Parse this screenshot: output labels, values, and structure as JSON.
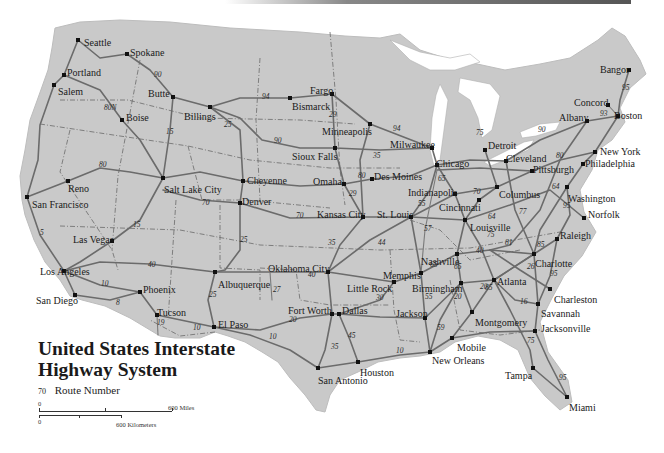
{
  "title": {
    "line1": "United States Interstate",
    "line2": "Highway System"
  },
  "legend": {
    "route_sample_number": "70",
    "route_label": "Route Number"
  },
  "scale": {
    "miles_zero": "0",
    "miles_label": "600 Miles",
    "km_zero": "0",
    "km_label": "600 Kilometers"
  },
  "colors": {
    "land": "#c9c9c9",
    "water": "#ffffff",
    "highway": "#6b6b6b",
    "city_dot": "#111111",
    "text": "#1a1a1a"
  },
  "cities": [
    {
      "name": "Seattle",
      "x": 78,
      "y": 40,
      "lx": 84,
      "ly": 43
    },
    {
      "name": "Spokane",
      "x": 127,
      "y": 54,
      "lx": 130,
      "ly": 53
    },
    {
      "name": "Portland",
      "x": 64,
      "y": 75,
      "lx": 67,
      "ly": 73
    },
    {
      "name": "Salem",
      "x": 54,
      "y": 85,
      "lx": 58,
      "ly": 92
    },
    {
      "name": "Butte",
      "x": 173,
      "y": 97,
      "lx": 148,
      "ly": 94
    },
    {
      "name": "Boise",
      "x": 122,
      "y": 120,
      "lx": 126,
      "ly": 118
    },
    {
      "name": "Billings",
      "x": 210,
      "y": 107,
      "lx": 184,
      "ly": 117
    },
    {
      "name": "Fargo",
      "x": 332,
      "y": 94,
      "lx": 310,
      "ly": 91
    },
    {
      "name": "Bismarck",
      "x": 290,
      "y": 98,
      "lx": 292,
      "ly": 107
    },
    {
      "name": "Minneapolis",
      "x": 370,
      "y": 124,
      "lx": 322,
      "ly": 132
    },
    {
      "name": "Milwaukee",
      "x": 432,
      "y": 148,
      "lx": 390,
      "ly": 145
    },
    {
      "name": "Sioux Falls",
      "x": 335,
      "y": 148,
      "lx": 292,
      "ly": 157
    },
    {
      "name": "Detroit",
      "x": 485,
      "y": 150,
      "lx": 488,
      "ly": 146
    },
    {
      "name": "Chicago",
      "x": 437,
      "y": 165,
      "lx": 436,
      "ly": 164
    },
    {
      "name": "Cleveland",
      "x": 506,
      "y": 161,
      "lx": 506,
      "ly": 159
    },
    {
      "name": "Bangor",
      "x": 629,
      "y": 70,
      "lx": 600,
      "ly": 70
    },
    {
      "name": "Concord",
      "x": 608,
      "y": 105,
      "lx": 574,
      "ly": 103
    },
    {
      "name": "Albany",
      "x": 587,
      "y": 121,
      "lx": 559,
      "ly": 118
    },
    {
      "name": "Boston",
      "x": 618,
      "y": 116,
      "lx": 614,
      "ly": 116
    },
    {
      "name": "New York",
      "x": 595,
      "y": 152,
      "lx": 600,
      "ly": 152
    },
    {
      "name": "Philadelphia",
      "x": 583,
      "y": 164,
      "lx": 585,
      "ly": 164
    },
    {
      "name": "Pittsburgh",
      "x": 532,
      "y": 171,
      "lx": 533,
      "ly": 170
    },
    {
      "name": "Washington",
      "x": 567,
      "y": 187,
      "lx": 568,
      "ly": 199
    },
    {
      "name": "Norfolk",
      "x": 584,
      "y": 218,
      "lx": 588,
      "ly": 215
    },
    {
      "name": "Reno",
      "x": 68,
      "y": 181,
      "lx": 68,
      "ly": 189
    },
    {
      "name": "San Francisco",
      "x": 27,
      "y": 197,
      "lx": 32,
      "ly": 205
    },
    {
      "name": "Salt Lake City",
      "x": 163,
      "y": 178,
      "lx": 164,
      "ly": 190
    },
    {
      "name": "Cheyenne",
      "x": 243,
      "y": 181,
      "lx": 247,
      "ly": 181
    },
    {
      "name": "Omaha",
      "x": 344,
      "y": 184,
      "lx": 313,
      "ly": 182
    },
    {
      "name": "Des Moines",
      "x": 372,
      "y": 179,
      "lx": 374,
      "ly": 177
    },
    {
      "name": "Denver",
      "x": 240,
      "y": 203,
      "lx": 242,
      "ly": 202
    },
    {
      "name": "Kansas City",
      "x": 363,
      "y": 217,
      "lx": 317,
      "ly": 215
    },
    {
      "name": "St. Louis",
      "x": 411,
      "y": 217,
      "lx": 377,
      "ly": 215
    },
    {
      "name": "Indianapolis",
      "x": 455,
      "y": 194,
      "lx": 408,
      "ly": 193
    },
    {
      "name": "Columbus",
      "x": 497,
      "y": 187,
      "lx": 499,
      "ly": 195
    },
    {
      "name": "Cincinnati",
      "x": 479,
      "y": 200,
      "lx": 439,
      "ly": 208
    },
    {
      "name": "Louisville",
      "x": 465,
      "y": 220,
      "lx": 470,
      "ly": 228
    },
    {
      "name": "Raleigh",
      "x": 557,
      "y": 239,
      "lx": 560,
      "ly": 236
    },
    {
      "name": "Las Vegas",
      "x": 112,
      "y": 241,
      "lx": 73,
      "ly": 240
    },
    {
      "name": "Los Angeles",
      "x": 64,
      "y": 271,
      "lx": 40,
      "ly": 272
    },
    {
      "name": "San Diego",
      "x": 75,
      "y": 295,
      "lx": 36,
      "ly": 301
    },
    {
      "name": "Phoenix",
      "x": 140,
      "y": 292,
      "lx": 143,
      "ly": 290
    },
    {
      "name": "Tucson",
      "x": 157,
      "y": 315,
      "lx": 157,
      "ly": 313
    },
    {
      "name": "Albuquerque",
      "x": 215,
      "y": 272,
      "lx": 218,
      "ly": 285
    },
    {
      "name": "El Paso",
      "x": 214,
      "y": 327,
      "lx": 218,
      "ly": 325
    },
    {
      "name": "Oklahoma City",
      "x": 328,
      "y": 272,
      "lx": 268,
      "ly": 269
    },
    {
      "name": "Memphis",
      "x": 421,
      "y": 273,
      "lx": 383,
      "ly": 276
    },
    {
      "name": "Nashville",
      "x": 457,
      "y": 254,
      "lx": 421,
      "ly": 262
    },
    {
      "name": "Little Rock",
      "x": 394,
      "y": 282,
      "lx": 347,
      "ly": 289
    },
    {
      "name": "Birmingham",
      "x": 461,
      "y": 283,
      "lx": 412,
      "ly": 289
    },
    {
      "name": "Charlotte",
      "x": 534,
      "y": 254,
      "lx": 535,
      "ly": 264
    },
    {
      "name": "Atlanta",
      "x": 494,
      "y": 280,
      "lx": 497,
      "ly": 282
    },
    {
      "name": "Fort Worth",
      "x": 332,
      "y": 314,
      "lx": 288,
      "ly": 311
    },
    {
      "name": "Dallas",
      "x": 339,
      "y": 314,
      "lx": 342,
      "ly": 311
    },
    {
      "name": "Jackson",
      "x": 425,
      "y": 318,
      "lx": 396,
      "ly": 314
    },
    {
      "name": "Montgomery",
      "x": 472,
      "y": 312,
      "lx": 475,
      "ly": 323
    },
    {
      "name": "Charleston",
      "x": 550,
      "y": 289,
      "lx": 554,
      "ly": 300
    },
    {
      "name": "Savannah",
      "x": 538,
      "y": 304,
      "lx": 541,
      "ly": 314
    },
    {
      "name": "Jacksonville",
      "x": 535,
      "y": 331,
      "lx": 541,
      "ly": 329
    },
    {
      "name": "Mobile",
      "x": 452,
      "y": 338,
      "lx": 457,
      "ly": 348
    },
    {
      "name": "New Orleans",
      "x": 430,
      "y": 352,
      "lx": 432,
      "ly": 361
    },
    {
      "name": "San Antonio",
      "x": 318,
      "y": 368,
      "lx": 318,
      "ly": 381
    },
    {
      "name": "Houston",
      "x": 358,
      "y": 362,
      "lx": 360,
      "ly": 373
    },
    {
      "name": "Tampa",
      "x": 533,
      "y": 368,
      "lx": 505,
      "ly": 376
    },
    {
      "name": "Miami",
      "x": 567,
      "y": 397,
      "lx": 569,
      "ly": 408
    }
  ],
  "route_numbers": [
    {
      "n": "90",
      "x": 154,
      "y": 77
    },
    {
      "n": "80N",
      "x": 104,
      "y": 110
    },
    {
      "n": "15",
      "x": 166,
      "y": 134
    },
    {
      "n": "94",
      "x": 262,
      "y": 99
    },
    {
      "n": "29",
      "x": 329,
      "y": 117
    },
    {
      "n": "25",
      "x": 224,
      "y": 127
    },
    {
      "n": "90",
      "x": 274,
      "y": 143
    },
    {
      "n": "94",
      "x": 393,
      "y": 131
    },
    {
      "n": "35",
      "x": 373,
      "y": 158
    },
    {
      "n": "80",
      "x": 99,
      "y": 167
    },
    {
      "n": "70",
      "x": 202,
      "y": 205
    },
    {
      "n": "80",
      "x": 358,
      "y": 178
    },
    {
      "n": "29",
      "x": 349,
      "y": 196
    },
    {
      "n": "70",
      "x": 296,
      "y": 218
    },
    {
      "n": "55",
      "x": 418,
      "y": 206
    },
    {
      "n": "65",
      "x": 438,
      "y": 181
    },
    {
      "n": "70",
      "x": 473,
      "y": 194
    },
    {
      "n": "75",
      "x": 476,
      "y": 135
    },
    {
      "n": "90",
      "x": 538,
      "y": 132
    },
    {
      "n": "80",
      "x": 556,
      "y": 158
    },
    {
      "n": "95",
      "x": 622,
      "y": 90
    },
    {
      "n": "93",
      "x": 600,
      "y": 116
    },
    {
      "n": "64",
      "x": 552,
      "y": 189
    },
    {
      "n": "95",
      "x": 563,
      "y": 208
    },
    {
      "n": "5",
      "x": 40,
      "y": 235
    },
    {
      "n": "15",
      "x": 133,
      "y": 227
    },
    {
      "n": "25",
      "x": 240,
      "y": 242
    },
    {
      "n": "35",
      "x": 328,
      "y": 245
    },
    {
      "n": "44",
      "x": 378,
      "y": 245
    },
    {
      "n": "57",
      "x": 424,
      "y": 231
    },
    {
      "n": "64",
      "x": 488,
      "y": 219
    },
    {
      "n": "77",
      "x": 519,
      "y": 214
    },
    {
      "n": "75",
      "x": 487,
      "y": 237
    },
    {
      "n": "81",
      "x": 505,
      "y": 245
    },
    {
      "n": "85",
      "x": 537,
      "y": 247
    },
    {
      "n": "40",
      "x": 148,
      "y": 267
    },
    {
      "n": "40",
      "x": 476,
      "y": 253
    },
    {
      "n": "10",
      "x": 101,
      "y": 286
    },
    {
      "n": "8",
      "x": 116,
      "y": 305
    },
    {
      "n": "27",
      "x": 273,
      "y": 292
    },
    {
      "n": "25",
      "x": 209,
      "y": 297
    },
    {
      "n": "40",
      "x": 308,
      "y": 277
    },
    {
      "n": "30",
      "x": 376,
      "y": 300
    },
    {
      "n": "65",
      "x": 430,
      "y": 267
    },
    {
      "n": "55",
      "x": 425,
      "y": 299
    },
    {
      "n": "85",
      "x": 485,
      "y": 290
    },
    {
      "n": "20",
      "x": 480,
      "y": 289
    },
    {
      "n": "95",
      "x": 550,
      "y": 276
    },
    {
      "n": "26",
      "x": 527,
      "y": 269
    },
    {
      "n": "20",
      "x": 454,
      "y": 299
    },
    {
      "n": "59",
      "x": 437,
      "y": 330
    },
    {
      "n": "16",
      "x": 520,
      "y": 304
    },
    {
      "n": "10",
      "x": 193,
      "y": 330
    },
    {
      "n": "19",
      "x": 157,
      "y": 325
    },
    {
      "n": "10",
      "x": 269,
      "y": 339
    },
    {
      "n": "20",
      "x": 289,
      "y": 322
    },
    {
      "n": "45",
      "x": 348,
      "y": 338
    },
    {
      "n": "35",
      "x": 331,
      "y": 349
    },
    {
      "n": "10",
      "x": 396,
      "y": 353
    },
    {
      "n": "75",
      "x": 527,
      "y": 343
    },
    {
      "n": "95",
      "x": 559,
      "y": 380
    },
    {
      "n": "65",
      "x": 454,
      "y": 269
    }
  ]
}
